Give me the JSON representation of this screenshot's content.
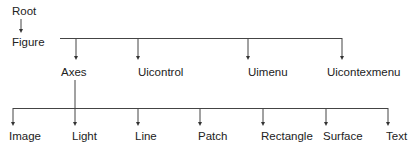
{
  "diagram": {
    "type": "hierarchy-tree",
    "root": {
      "label": "Root"
    },
    "figure": {
      "label": "Figure"
    },
    "level2": [
      {
        "label": "Axes"
      },
      {
        "label": "Uicontrol"
      },
      {
        "label": "Uimenu"
      },
      {
        "label": "Uicontexmenu"
      }
    ],
    "level3": [
      {
        "label": "Image"
      },
      {
        "label": "Light"
      },
      {
        "label": "Line"
      },
      {
        "label": "Patch"
      },
      {
        "label": "Rectangle"
      },
      {
        "label": "Surface"
      },
      {
        "label": "Text"
      }
    ],
    "edges": [
      [
        "Root",
        "Figure"
      ],
      [
        "Figure",
        "Axes"
      ],
      [
        "Figure",
        "Uicontrol"
      ],
      [
        "Figure",
        "Uimenu"
      ],
      [
        "Figure",
        "Uicontexmenu"
      ],
      [
        "Axes",
        "Image"
      ],
      [
        "Axes",
        "Light"
      ],
      [
        "Axes",
        "Line"
      ],
      [
        "Axes",
        "Patch"
      ],
      [
        "Axes",
        "Rectangle"
      ],
      [
        "Axes",
        "Surface"
      ],
      [
        "Axes",
        "Text"
      ]
    ],
    "colors": {
      "line": "#333333",
      "text": "#222222",
      "background": "#ffffff"
    }
  }
}
